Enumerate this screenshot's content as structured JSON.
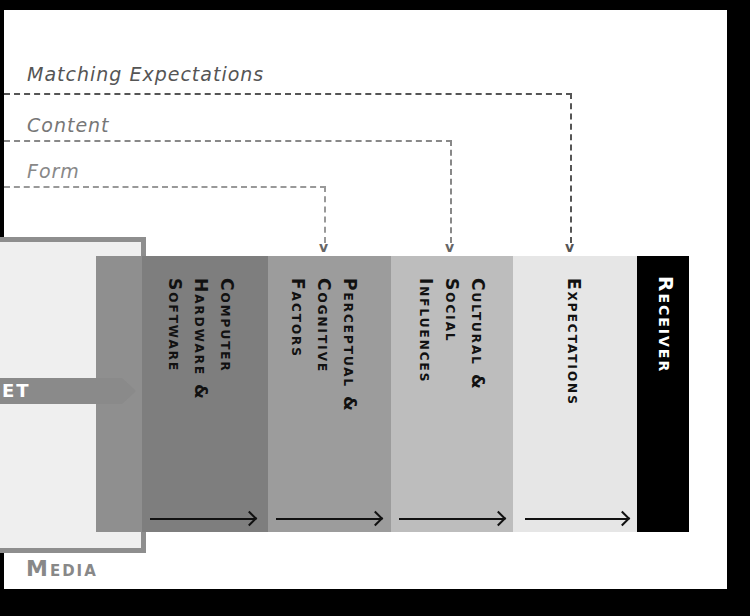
{
  "flows": [
    {
      "label": "Matching Expectations",
      "color": "#555555",
      "target": "Expectations"
    },
    {
      "label": "Content",
      "color": "#777777",
      "target": "Cultural & Social Influences"
    },
    {
      "label": "Form",
      "color": "#888888",
      "target": "Perceptual & Cognitive Factors"
    }
  ],
  "pointer_label": "ET",
  "media_label": "Media",
  "columns": [
    {
      "label": "Computer\nHardware &\nSoftware",
      "color": "#7e7e7e"
    },
    {
      "label": "Perceptual &\nCognitive\nFactors",
      "color": "#9c9c9c"
    },
    {
      "label": "Cultural &\nSocial\nInfluences",
      "color": "#bdbdbd"
    },
    {
      "label": "Expectations",
      "color": "#e6e6e6"
    }
  ],
  "receiver_label": "Receiver",
  "colors": {
    "media_strip": "#8f8f8f",
    "receiver_bg": "#000000",
    "background": "#ffffff",
    "frame": "#000000"
  }
}
